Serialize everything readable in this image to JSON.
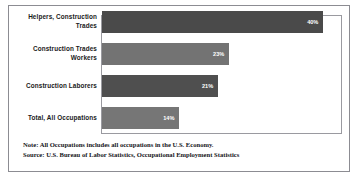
{
  "chart_data": {
    "type": "bar",
    "orientation": "horizontal",
    "title": "",
    "xlabel": "",
    "ylabel": "",
    "categories": [
      "Helpers, Construction Trades",
      "Construction Trades Workers",
      "Construction Laborers",
      "Total, All Occupations"
    ],
    "values": [
      40,
      23,
      21,
      14
    ],
    "value_labels": [
      "40%",
      "23%",
      "21%",
      "14%"
    ],
    "units": "percent",
    "xlim": [
      0,
      45
    ],
    "grid": false,
    "legend": "none",
    "bar_colors": [
      "#4a4a4a",
      "#737373",
      "#4f4f4f",
      "#767676"
    ]
  },
  "footnotes": {
    "note": "Note: All Occupations includes all occupations in the U.S. Economy.",
    "source": "Source: U.S. Bureau of Labor Statistics, Occupational Employment Statistics"
  },
  "style": {
    "frame_color": "#8c8c92",
    "plot_border_color": "#9a9aa0",
    "background": "#ffffff",
    "label_color": "#1a1a1a",
    "value_label_color": "#ffffff"
  }
}
